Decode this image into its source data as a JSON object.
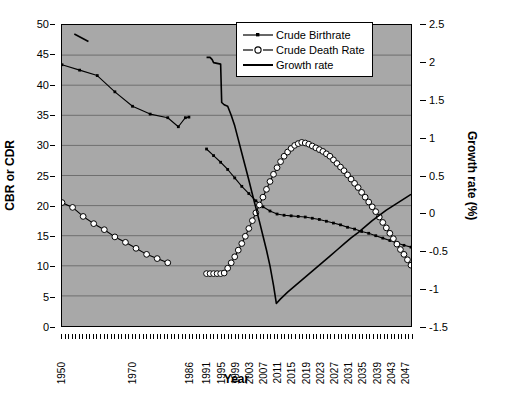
{
  "chart_data": {
    "type": "line",
    "title": "",
    "xlabel": "Year",
    "ylabel": "CBR or CDR",
    "y2label": "Growth rate (%)",
    "grid": true,
    "legend_position": "top-right",
    "xlim": [
      1950,
      2049
    ],
    "ylim": [
      0,
      50
    ],
    "y2lim": [
      -1.5,
      2.5
    ],
    "ytick_labels": [
      "0",
      "5",
      "10",
      "15",
      "20",
      "25",
      "30",
      "35",
      "40",
      "45",
      "50"
    ],
    "ytick_values": [
      0,
      5,
      10,
      15,
      20,
      25,
      30,
      35,
      40,
      45,
      50
    ],
    "y2tick_labels": [
      "-1.5",
      "-1",
      "-0.5",
      "0",
      "0.5",
      "1",
      "1.5",
      "2",
      "2.5"
    ],
    "y2tick_values": [
      -1.5,
      -1,
      -0.5,
      0,
      0.5,
      1,
      1.5,
      2,
      2.5
    ],
    "xtick_labels": [
      "1950",
      "1970",
      "1986",
      "1991",
      "1995",
      "1999",
      "2003",
      "2007",
      "2011",
      "2015",
      "2019",
      "2023",
      "2027",
      "2031",
      "2035",
      "2039",
      "2043",
      "2047"
    ],
    "xtick_values": [
      1950,
      1970,
      1986,
      1991,
      1995,
      1999,
      2003,
      2007,
      2011,
      2015,
      2019,
      2023,
      2027,
      2031,
      2035,
      2039,
      2043,
      2047
    ],
    "series": [
      {
        "name": "Crude Birthrate",
        "axis": "left",
        "marker": "small-filled-square",
        "color": "#000000",
        "segments": [
          {
            "x": [
              1950,
              1955,
              1960,
              1965,
              1970,
              1975,
              1980,
              1983,
              1985,
              1986
            ],
            "y": [
              43.4,
              42.5,
              41.6,
              38.9,
              36.5,
              35.2,
              34.6,
              33.1,
              34.6,
              34.7
            ]
          },
          {
            "x": [
              1991,
              1993,
              1995,
              1997,
              1999,
              2001,
              2003,
              2005,
              2007,
              2009,
              2011,
              2013,
              2015,
              2017,
              2019,
              2021,
              2023,
              2025,
              2027,
              2029,
              2031,
              2033,
              2035,
              2037,
              2039,
              2041,
              2043,
              2045,
              2047,
              2049
            ],
            "y": [
              29.4,
              28.3,
              27.2,
              26.0,
              24.6,
              23.2,
              22.0,
              20.8,
              19.8,
              19.1,
              18.6,
              18.4,
              18.3,
              18.2,
              18.1,
              17.9,
              17.7,
              17.4,
              17.1,
              16.8,
              16.4,
              16.1,
              15.7,
              15.4,
              15.0,
              14.6,
              14.2,
              13.8,
              13.4,
              13.1
            ]
          }
        ]
      },
      {
        "name": "Crude Death Rate",
        "axis": "left",
        "marker": "open-circle",
        "color": "#000000",
        "segments": [
          {
            "x": [
              1950,
              1953,
              1956,
              1959,
              1962,
              1965,
              1968,
              1971,
              1974,
              1977,
              1980
            ],
            "y": [
              20.5,
              19.7,
              18.2,
              17.0,
              16.0,
              14.8,
              13.9,
              12.9,
              11.9,
              11.2,
              10.5
            ]
          },
          {
            "x": [
              1991,
              1992,
              1993,
              1994,
              1995,
              1996,
              1997,
              1998,
              1999,
              2000,
              2001,
              2002,
              2003,
              2004,
              2005,
              2006,
              2007,
              2008,
              2009,
              2010,
              2011,
              2012,
              2013,
              2014,
              2015,
              2016,
              2017,
              2018,
              2019,
              2020,
              2021,
              2022,
              2023,
              2024,
              2025,
              2026,
              2027,
              2028,
              2029,
              2030,
              2031,
              2032,
              2033,
              2034,
              2035,
              2036,
              2037,
              2038,
              2039,
              2040,
              2041,
              2042,
              2043,
              2044,
              2045,
              2046,
              2047,
              2048,
              2049
            ],
            "y": [
              8.7,
              8.7,
              8.7,
              8.7,
              8.7,
              8.8,
              9.6,
              10.5,
              11.5,
              12.6,
              13.7,
              14.9,
              16.2,
              17.5,
              18.8,
              20.1,
              21.4,
              22.7,
              24.0,
              25.2,
              26.3,
              27.3,
              28.2,
              28.9,
              29.5,
              30.0,
              30.3,
              30.5,
              30.4,
              30.2,
              29.9,
              29.6,
              29.3,
              29.0,
              28.6,
              28.2,
              27.6,
              27.0,
              26.4,
              25.8,
              25.1,
              24.4,
              23.7,
              23.0,
              22.2,
              21.4,
              20.6,
              19.8,
              19.0,
              18.1,
              17.2,
              16.3,
              15.4,
              14.5,
              13.6,
              12.7,
              11.9,
              11.0,
              10.1
            ]
          }
        ]
      },
      {
        "name": "Growth rate",
        "axis": "right",
        "marker": "none",
        "color": "#000000",
        "segments": [
          {
            "x": [
              1953.5,
              1957.5
            ],
            "y": [
              2.38,
              2.28
            ]
          },
          {
            "x": [
              1991,
              1992,
              1992.6,
              1993,
              1994,
              1995,
              1995.3,
              1996,
              1997,
              1998,
              1999,
              2000,
              2001,
              2002,
              2003,
              2004,
              2005,
              2006,
              2007,
              2008,
              2009,
              2010,
              2010.8,
              2012,
              2014,
              2016,
              2018,
              2020,
              2022,
              2024,
              2026,
              2028,
              2030,
              2032,
              2034,
              2036,
              2038,
              2040,
              2042,
              2044,
              2046,
              2048,
              2049
            ],
            "y": [
              2.07,
              2.07,
              2.04,
              2.0,
              1.99,
              1.98,
              1.47,
              1.44,
              1.42,
              1.3,
              1.16,
              0.98,
              0.8,
              0.62,
              0.44,
              0.25,
              0.07,
              -0.11,
              -0.3,
              -0.49,
              -0.7,
              -0.96,
              -1.2,
              -1.14,
              -1.05,
              -0.97,
              -0.89,
              -0.81,
              -0.73,
              -0.65,
              -0.57,
              -0.49,
              -0.41,
              -0.33,
              -0.26,
              -0.18,
              -0.1,
              -0.03,
              0.04,
              0.1,
              0.16,
              0.22,
              0.25
            ]
          }
        ]
      }
    ]
  },
  "axes": {
    "left_title": "CBR or CDR",
    "right_title": "Growth rate (%)",
    "bottom_title": "Year"
  },
  "legend": {
    "items": [
      {
        "label": "Crude Birthrate",
        "key": "line-with-small-square-marker"
      },
      {
        "label": "Crude Death Rate",
        "key": "line-with-open-circle-marker"
      },
      {
        "label": "Growth rate",
        "key": "plain-line"
      }
    ]
  },
  "colors": {
    "plot_background": "#a8a8a8",
    "gridline": "#6e6e6e",
    "axis": "#000000",
    "series": "#000000",
    "legend_background": "#ffffff"
  }
}
